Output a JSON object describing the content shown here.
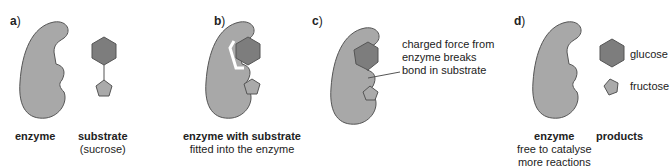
{
  "colors": {
    "enzyme": "#a8a8a8",
    "glucose": "#7d7d7d",
    "fructose": "#aaaaaa",
    "outline": "#555555"
  },
  "panels": {
    "a": {
      "letter": "a",
      "enzyme_label": "enzyme",
      "substrate_label": "substrate",
      "substrate_sub": "(sucrose)"
    },
    "b": {
      "letter": "b",
      "title": "enzyme with substrate",
      "subtitle": "fitted into the enzyme"
    },
    "c": {
      "letter": "c",
      "annotation_1": "charged force from",
      "annotation_2": "enzyme breaks",
      "annotation_3": "bond in substrate"
    },
    "d": {
      "letter": "d",
      "enzyme_label": "enzyme",
      "enzyme_sub_1": "free to catalyse",
      "enzyme_sub_2": "more reactions",
      "products_label": "products",
      "glucose": "glucose",
      "fructose": "fructose"
    }
  }
}
